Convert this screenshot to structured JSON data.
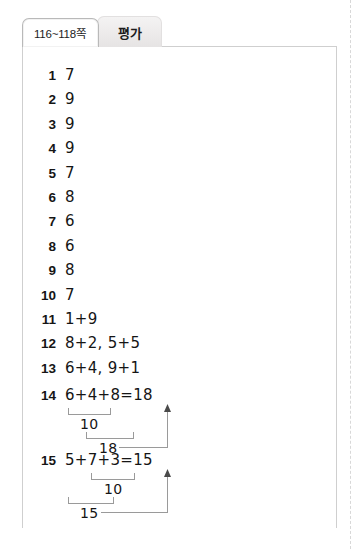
{
  "tabs": [
    {
      "label": "116~118쪽",
      "state": "active",
      "name": "tab-pages-116-118"
    },
    {
      "label": "평가",
      "state": "inactive",
      "name": "tab-evaluation"
    }
  ],
  "answers": [
    {
      "number": "1",
      "value": "7"
    },
    {
      "number": "2",
      "value": "9"
    },
    {
      "number": "3",
      "value": "9"
    },
    {
      "number": "4",
      "value": "9"
    },
    {
      "number": "5",
      "value": "7"
    },
    {
      "number": "6",
      "value": "8"
    },
    {
      "number": "7",
      "value": "6"
    },
    {
      "number": "8",
      "value": "6"
    },
    {
      "number": "9",
      "value": "8"
    },
    {
      "number": "10",
      "value": "7"
    },
    {
      "number": "11",
      "value": "1+9"
    },
    {
      "number": "12",
      "value": "8+2, 5+5"
    },
    {
      "number": "13",
      "value": "6+4, 9+1"
    }
  ],
  "worked": [
    {
      "number": "14",
      "expression": "6+4+8=18",
      "inner_sum": "10",
      "outer_sum": "18",
      "result": "18",
      "grouping": "left"
    },
    {
      "number": "15",
      "expression": "5+7+3=15",
      "inner_sum": "10",
      "outer_sum": "15",
      "result": "15",
      "grouping": "right"
    }
  ],
  "colors": {
    "rule": "#9a9a9a",
    "panel_border": "#cfcfcf",
    "tab_active_bg": "#ffffff",
    "tab_inactive_bg": "#eceaea",
    "text": "#151515"
  }
}
